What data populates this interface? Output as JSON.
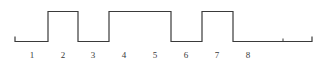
{
  "figure": {
    "kind": "digital-waveform-timing-diagram",
    "background_color": "#ffffff",
    "trace_color": "#3a3a3a",
    "label_color": "#3a3a3a",
    "trace_width": 1.2
  },
  "axis": {
    "bit_labels": [
      "1",
      "2",
      "3",
      "4",
      "5",
      "6",
      "7",
      "8"
    ],
    "label_x_positions": [
      32,
      63,
      93,
      124,
      155,
      186,
      217,
      248
    ],
    "label_y": 50,
    "bit_width": 31,
    "first_bit_center": 32
  },
  "chart_data": {
    "type": "line",
    "title": "",
    "xlabel": "",
    "ylabel": "",
    "categories": [
      "1",
      "2",
      "3",
      "4",
      "5",
      "6",
      "7",
      "8"
    ],
    "series": [
      {
        "name": "signal",
        "values": [
          0,
          1,
          0,
          1,
          1,
          0,
          1,
          0
        ]
      }
    ],
    "ylim": [
      0,
      1
    ],
    "grid": false,
    "legend": "none",
    "level_y": {
      "low": 41.5,
      "high": 11.5
    },
    "start_x": 15,
    "end_x": 312,
    "tick_x": 283,
    "end_stub_height": 5,
    "transitions": [
      {
        "x": 47,
        "edge": "rise"
      },
      {
        "x": 78,
        "edge": "fall"
      },
      {
        "x": 109,
        "edge": "rise"
      },
      {
        "x": 171,
        "edge": "fall"
      },
      {
        "x": 202,
        "edge": "rise"
      },
      {
        "x": 233,
        "edge": "fall"
      }
    ],
    "path": "M 15 36.5 L 15 41.5 L 47 41.5 L 47 11.5 L 78 11.5 L 78 41.5 L 109 41.5 L 109 11.5 L 171 11.5 L 171 41.5 L 202 41.5 L 202 11.5 L 233 11.5 L 233 41.5 L 312 41.5 L 312 36.5"
  }
}
